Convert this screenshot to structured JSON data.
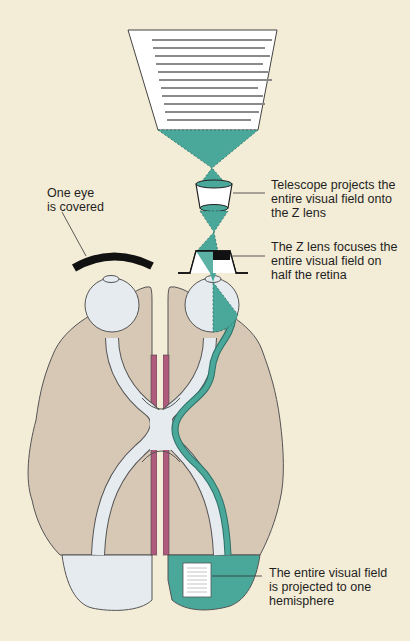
{
  "figure": {
    "colors": {
      "background": "#f3ecd6",
      "brain": "#d7c8b6",
      "pathway": "#e6ebf0",
      "teal": "#4aa89b",
      "pink": "#b05a7e",
      "outline": "#555555",
      "ink": "#111111"
    },
    "labels": {
      "eye_covered": "One eye\nis covered",
      "telescope": "Telescope projects the\nentire visual field onto\nthe Z lens",
      "z_lens": "The Z lens focuses the\nentire visual field on\nhalf the retina",
      "hemisphere": "The entire visual field\nis projected to one\nhemisphere"
    },
    "elements": {
      "visual_field_screen": "text-page",
      "telescope": "lens",
      "z_lens": "contact-lens",
      "eye_cover": "occluder",
      "left_eye": "eyeball",
      "right_eye": "eyeball",
      "brain": "brain-top-view",
      "midline": "corpus-callosum-cut"
    }
  }
}
